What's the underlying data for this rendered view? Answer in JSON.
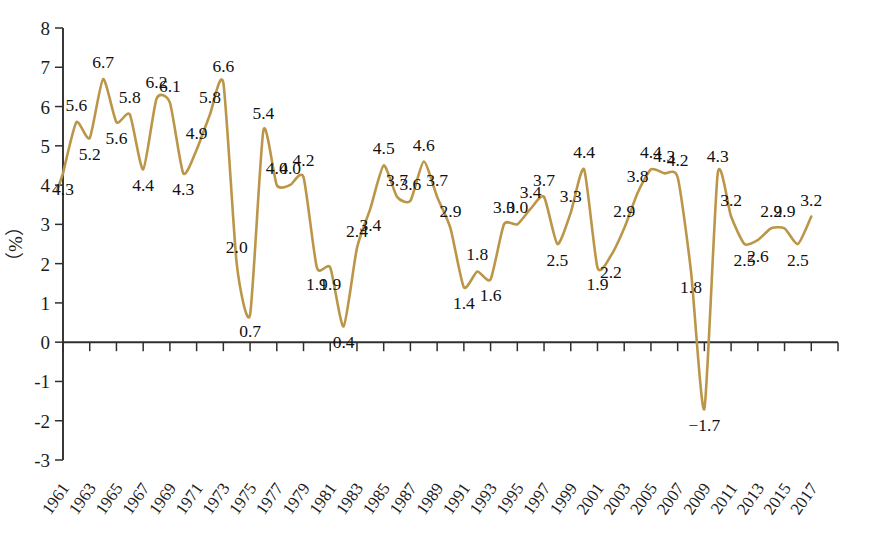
{
  "chart_data": {
    "type": "line",
    "title": "",
    "subtitle": "",
    "xlabel": "",
    "ylabel": "（%）",
    "ylim": [
      -3,
      8
    ],
    "ytick_labels": [
      "8",
      "7",
      "6",
      "5",
      "4",
      "3",
      "2",
      "1",
      "0",
      "-1",
      "-2",
      "-3"
    ],
    "yticks": [
      8,
      7,
      6,
      5,
      4,
      3,
      2,
      1,
      0,
      -1,
      -2,
      -3
    ],
    "grid": false,
    "legend": null,
    "xtick_labels": [
      "1961",
      "1963",
      "1965",
      "1967",
      "1969",
      "1971",
      "1973",
      "1975",
      "1977",
      "1979",
      "1981",
      "1983",
      "1985",
      "1987",
      "1989",
      "1991",
      "1993",
      "1995",
      "1997",
      "1999",
      "2001",
      "2003",
      "2005",
      "2007",
      "2009",
      "2011",
      "2013",
      "2015",
      "2017"
    ],
    "x": [
      1961,
      1962,
      1963,
      1964,
      1965,
      1966,
      1967,
      1968,
      1969,
      1970,
      1971,
      1972,
      1973,
      1974,
      1975,
      1976,
      1977,
      1978,
      1979,
      1980,
      1981,
      1982,
      1983,
      1984,
      1985,
      1986,
      1987,
      1988,
      1989,
      1990,
      1991,
      1992,
      1993,
      1994,
      1995,
      1996,
      1997,
      1998,
      1999,
      2000,
      2001,
      2002,
      2003,
      2004,
      2005,
      2006,
      2007,
      2008,
      2009,
      2010,
      2011,
      2012,
      2013,
      2014,
      2015,
      2016,
      2017
    ],
    "values": [
      4.3,
      5.6,
      5.2,
      6.7,
      5.6,
      5.8,
      4.4,
      6.2,
      6.1,
      4.3,
      4.9,
      5.8,
      6.6,
      2.0,
      0.7,
      5.4,
      4.0,
      4.0,
      4.2,
      1.9,
      1.9,
      0.4,
      2.4,
      3.4,
      4.5,
      3.7,
      3.6,
      4.6,
      3.7,
      2.9,
      1.4,
      1.8,
      1.6,
      3.0,
      3.0,
      3.4,
      3.7,
      2.5,
      3.3,
      4.4,
      1.9,
      2.2,
      2.9,
      3.8,
      4.4,
      4.3,
      4.2,
      1.8,
      -1.7,
      4.3,
      3.2,
      2.5,
      2.6,
      2.9,
      2.9,
      2.5,
      3.2
    ],
    "point_labels": [
      "4.3",
      "5.6",
      "5.2",
      "6.7",
      "5.6",
      "5.8",
      "4.4",
      "6.2",
      "6.1",
      "4.3",
      "4.9",
      "5.8",
      "6.6",
      "2.0",
      "0.7",
      "5.4",
      "4.0",
      "4.0",
      "4.2",
      "1.9",
      "1.9",
      "0.4",
      "2.4",
      "3.4",
      "4.5",
      "3.7",
      "3.6",
      "4.6",
      "3.7",
      "2.9",
      "1.4",
      "1.8",
      "1.6",
      "3.0",
      "3.0",
      "3.4",
      "3.7",
      "2.5",
      "3.3",
      "4.4",
      "1.9",
      "2.2",
      "2.9",
      "3.8",
      "4.4",
      "4.3",
      "4.2",
      "1.8",
      "−1.7",
      "4.3",
      "3.2",
      "2.5",
      "2.6",
      "2.9",
      "2.9",
      "2.5",
      "3.2"
    ],
    "label_side": [
      "below",
      "above",
      "below",
      "above",
      "below",
      "above",
      "below",
      "above",
      "above",
      "below",
      "above",
      "above",
      "above",
      "above",
      "below",
      "above",
      "above",
      "above",
      "above",
      "below",
      "below",
      "below",
      "above",
      "below",
      "above",
      "above",
      "above",
      "above",
      "above",
      "above",
      "below",
      "above",
      "below",
      "above",
      "above",
      "above",
      "above",
      "below",
      "above",
      "above",
      "below",
      "below",
      "above",
      "above",
      "above",
      "above",
      "above",
      "below",
      "below",
      "above",
      "above",
      "below",
      "below",
      "above",
      "above",
      "below",
      "above"
    ],
    "series_color": "#bb9648",
    "axis_color": "#2f2f2f",
    "text_color": "#1b1b1b"
  }
}
